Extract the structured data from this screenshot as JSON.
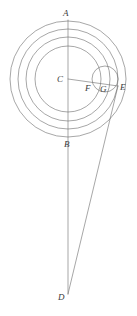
{
  "canvas": {
    "width": 137,
    "height": 316,
    "background": "#ffffff"
  },
  "figure": {
    "stroke_color": "#6b6b6b",
    "label_color": "#3a3a3a",
    "stroke_width": 0.6
  },
  "points": {
    "A": {
      "label": "A",
      "x": 68,
      "y": 21,
      "label_x": 63,
      "label_y": 9
    },
    "B": {
      "label": "B",
      "x": 68,
      "y": 137,
      "label_x": 64,
      "label_y": 140
    },
    "C": {
      "label": "C",
      "x": 68,
      "y": 79,
      "label_x": 57,
      "label_y": 75
    },
    "D": {
      "label": "D",
      "x": 68,
      "y": 294,
      "label_x": 58,
      "label_y": 293
    },
    "E": {
      "label": "E",
      "x": 118,
      "y": 86,
      "label_x": 120,
      "label_y": 83
    },
    "F": {
      "label": "F",
      "x": 92,
      "y": 83,
      "label_x": 85,
      "label_y": 84
    },
    "G": {
      "label": "G",
      "x": 106,
      "y": 85,
      "label_x": 100,
      "label_y": 85
    }
  },
  "concentric_circles": [
    {
      "name": "circle-outer",
      "cx": 68,
      "cy": 79,
      "r": 58
    },
    {
      "name": "circle-third",
      "cx": 68,
      "cy": 79,
      "r": 50
    },
    {
      "name": "circle-second",
      "cx": 68,
      "cy": 79,
      "r": 42
    },
    {
      "name": "circle-inner",
      "cx": 68,
      "cy": 79,
      "r": 33
    }
  ],
  "epicycle": {
    "name": "epicycle",
    "cx": 105,
    "cy": 79,
    "r": 13
  },
  "lines": [
    {
      "name": "axis-line-A-D",
      "x1": 68,
      "y1": 20,
      "x2": 68,
      "y2": 294
    },
    {
      "name": "radius-line-C-E",
      "x1": 68,
      "y1": 79,
      "x2": 118,
      "y2": 86
    },
    {
      "name": "sight-line-E-D",
      "x1": 118,
      "y1": 86,
      "x2": 68,
      "y2": 294
    }
  ]
}
